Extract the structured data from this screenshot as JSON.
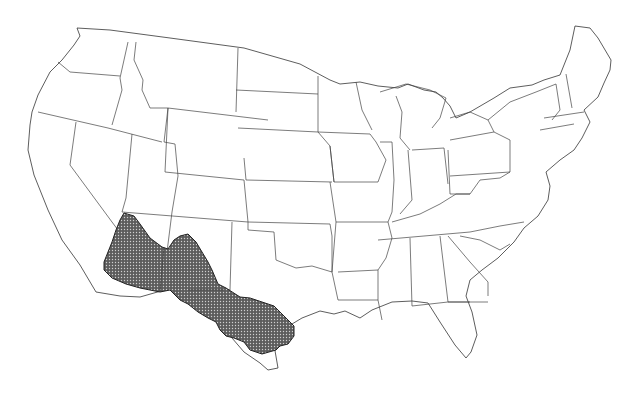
{
  "map": {
    "title": "United States outline map with shaded distribution range",
    "region_shaded": [
      "Southern Arizona",
      "Southwestern New Mexico",
      "West Texas"
    ],
    "colors": {
      "background": "#ffffff",
      "state_stroke": "#333333",
      "range_fill": "#6e6e6e",
      "range_pattern_dot": "#d9d9d9"
    }
  },
  "caption": {
    "text": ""
  }
}
